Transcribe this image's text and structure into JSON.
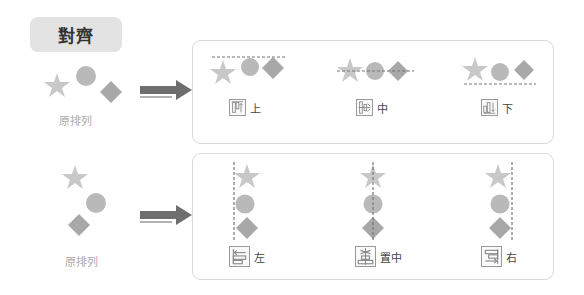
{
  "title": "對齊",
  "colors": {
    "star": "#c8c8c8",
    "circle": "#b9b9b9",
    "diamond": "#a8a8a8",
    "arrow": "#6e6e6e",
    "guide": "#777777",
    "pill_bg": "#e3e3e3",
    "panel_border": "#d9d9d9"
  },
  "rows": [
    {
      "original_caption": "原排列",
      "options": [
        {
          "icon": "align-top-icon",
          "label": "上"
        },
        {
          "icon": "align-middle-icon",
          "label": "中"
        },
        {
          "icon": "align-bottom-icon",
          "label": "下"
        }
      ]
    },
    {
      "original_caption": "原排列",
      "options": [
        {
          "icon": "align-left-icon",
          "label": "左"
        },
        {
          "icon": "align-center-icon",
          "label": "置中"
        },
        {
          "icon": "align-right-icon",
          "label": "右"
        }
      ]
    }
  ]
}
